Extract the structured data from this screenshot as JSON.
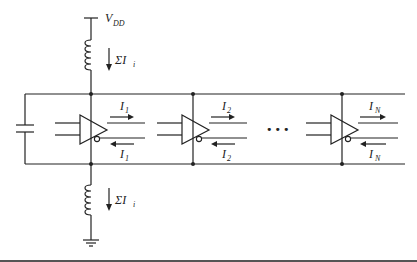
{
  "diagram": {
    "supply_label": "V",
    "supply_sub": "DD",
    "current_sum_label": "ΣI",
    "current_sum_sub": "i",
    "drivers": [
      {
        "name": "driver-1",
        "out_label": "I",
        "out_sub": "1",
        "ret_label": "I",
        "ret_sub": "1"
      },
      {
        "name": "driver-2",
        "out_label": "I",
        "out_sub": "2",
        "ret_label": "I",
        "ret_sub": "2"
      },
      {
        "name": "driver-N",
        "out_label": "I",
        "out_sub": "N",
        "ret_label": "I",
        "ret_sub": "N"
      }
    ],
    "ellipsis": "•••",
    "components": [
      "supply-inductor",
      "ground-inductor",
      "decoupling-capacitor",
      "ground-symbol"
    ],
    "colors": {
      "line": "#222222",
      "background": "#ffffff",
      "rule": "#555555"
    }
  }
}
